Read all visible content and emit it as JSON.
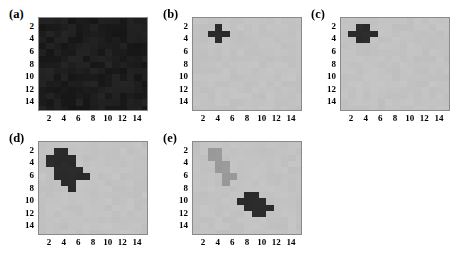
{
  "figure": {
    "width": 462,
    "height": 261,
    "background": "#ffffff",
    "panel_count": 5
  },
  "colors": {
    "page_background": "#ffffff",
    "axis_frame": "#8a8a8a",
    "tick_label": "#000000",
    "noise_dark": "#1d1d1d",
    "background_gray": "#c2c2c2",
    "blob_dark": "#2b2b2b",
    "blob_mid_gray": "#9a9a9a"
  },
  "axis": {
    "xticks": [
      2,
      4,
      6,
      8,
      10,
      12,
      14
    ],
    "yticks": [
      2,
      4,
      6,
      8,
      10,
      12,
      14
    ],
    "xlim": [
      0.5,
      15.5
    ],
    "ylim": [
      0.5,
      15.5
    ],
    "grid": false,
    "y_direction": "inverted"
  },
  "chart_data": {
    "type": "heatmap",
    "title": "",
    "xlabel": "",
    "ylabel": "",
    "grid_size": [
      15,
      15
    ],
    "xticks": [
      2,
      4,
      6,
      8,
      10,
      12,
      14
    ],
    "yticks": [
      2,
      4,
      6,
      8,
      10,
      12,
      14
    ],
    "xlim": [
      0.5,
      15.5
    ],
    "ylim": [
      0.5,
      15.5
    ],
    "legend": "none",
    "panels": [
      {
        "label": "(a)",
        "description": "uniform dark noisy field covering the entire 15x15 grid",
        "background_value": 0.08,
        "background_color": "#1d1d1d",
        "noise": true,
        "noise_amplitude": 0.03,
        "cells": []
      },
      {
        "label": "(b)",
        "description": "single dark plus/cross shape centered near (4,3)",
        "background_value": 0.76,
        "background_color": "#c2c2c2",
        "noise": true,
        "noise_amplitude": 0.012,
        "shape_color": "#2b2b2b",
        "cells": [
          [
            4,
            2
          ],
          [
            3,
            3
          ],
          [
            4,
            3
          ],
          [
            5,
            3
          ],
          [
            4,
            4
          ]
        ]
      },
      {
        "label": "(c)",
        "description": "dark blocky plus with wide horizontal arms centered near (3.5,3)",
        "background_value": 0.76,
        "background_color": "#c2c2c2",
        "noise": true,
        "noise_amplitude": 0.012,
        "shape_color": "#2b2b2b",
        "cells": [
          [
            3,
            2
          ],
          [
            4,
            2
          ],
          [
            2,
            3
          ],
          [
            3,
            3
          ],
          [
            4,
            3
          ],
          [
            5,
            3
          ],
          [
            3,
            4
          ],
          [
            4,
            4
          ]
        ]
      },
      {
        "label": "(d)",
        "description": "irregular diagonal dark blob spanning x 2-7 and y 2-8",
        "background_value": 0.76,
        "background_color": "#c2c2c2",
        "noise": true,
        "noise_amplitude": 0.012,
        "shape_color": "#2b2b2b",
        "cells": [
          [
            3,
            2
          ],
          [
            4,
            2
          ],
          [
            2,
            3
          ],
          [
            3,
            3
          ],
          [
            4,
            3
          ],
          [
            5,
            3
          ],
          [
            2,
            4
          ],
          [
            3,
            4
          ],
          [
            4,
            4
          ],
          [
            5,
            4
          ],
          [
            3,
            5
          ],
          [
            4,
            5
          ],
          [
            5,
            5
          ],
          [
            6,
            5
          ],
          [
            3,
            6
          ],
          [
            4,
            6
          ],
          [
            5,
            6
          ],
          [
            6,
            6
          ],
          [
            7,
            6
          ],
          [
            4,
            7
          ],
          [
            5,
            7
          ],
          [
            5,
            8
          ]
        ]
      },
      {
        "label": "(e)",
        "description": "two blobs: a mid-gray diagonal blob at upper-left and a dark diagonal blob at lower-centre",
        "background_value": 0.76,
        "background_color": "#c2c2c2",
        "noise": true,
        "noise_amplitude": 0.012,
        "shape_color": "#2b2b2b",
        "secondary_shape_color": "#9a9a9a",
        "cells": [
          [
            8,
            9
          ],
          [
            9,
            9
          ],
          [
            7,
            10
          ],
          [
            8,
            10
          ],
          [
            9,
            10
          ],
          [
            10,
            10
          ],
          [
            8,
            11
          ],
          [
            9,
            11
          ],
          [
            10,
            11
          ],
          [
            11,
            11
          ],
          [
            9,
            12
          ],
          [
            10,
            12
          ]
        ],
        "secondary_cells": [
          [
            3,
            2
          ],
          [
            4,
            2
          ],
          [
            3,
            3
          ],
          [
            4,
            3
          ],
          [
            4,
            4
          ],
          [
            5,
            4
          ],
          [
            4,
            5
          ],
          [
            5,
            5
          ],
          [
            5,
            6
          ],
          [
            6,
            6
          ],
          [
            5,
            7
          ]
        ]
      }
    ]
  }
}
